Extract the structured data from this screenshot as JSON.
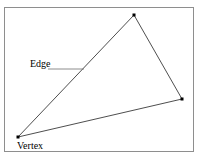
{
  "figure": {
    "clipped_caption_remnant": "",
    "background_color": "#ffffff",
    "border_color": "#8e8e8e",
    "stroke_color": "#3a3a3a",
    "marker_color": "#000000",
    "text_color": "#000000",
    "box": {
      "x": 4,
      "y": 7,
      "width": 190,
      "height": 145
    }
  },
  "labels": {
    "edge": "Edge",
    "vertex": "Vertex"
  },
  "chart_data": {
    "type": "diagram",
    "shape": "triangle",
    "vertices": [
      {
        "name": "top-vertex",
        "x": 134,
        "y": 15
      },
      {
        "name": "right-vertex",
        "x": 182,
        "y": 99
      },
      {
        "name": "bottom-left-vertex",
        "x": 18,
        "y": 137
      }
    ],
    "edges": [
      {
        "name": "left-edge",
        "from": "bottom-left-vertex",
        "to": "top-vertex"
      },
      {
        "name": "right-edge",
        "from": "top-vertex",
        "to": "right-vertex"
      },
      {
        "name": "bottom-edge",
        "from": "right-vertex",
        "to": "bottom-left-vertex"
      }
    ],
    "vertex_markers": {
      "shape": "square",
      "size": 3,
      "color": "#000000"
    },
    "annotations": [
      {
        "label": "Edge",
        "label_x": 30,
        "label_y": 58,
        "leader_line": {
          "x1": 48,
          "y1": 69,
          "x2": 84,
          "y2": 69
        },
        "points_to": "left-edge"
      },
      {
        "label": "Vertex",
        "label_x": 17,
        "label_y": 140,
        "points_to": "bottom-left-vertex"
      }
    ]
  }
}
